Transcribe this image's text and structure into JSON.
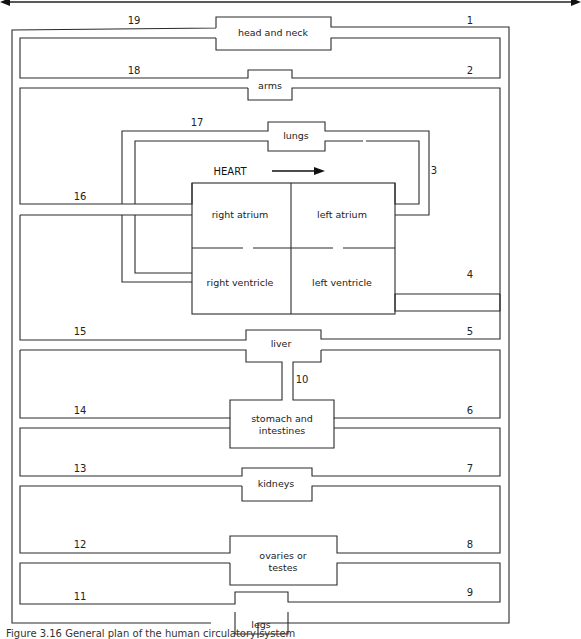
{
  "diagram": {
    "organs": {
      "head": "head and neck",
      "arms": "arms",
      "lungs": "lungs",
      "heart": "HEART",
      "right_atrium": "right atrium",
      "left_atrium": "left atrium",
      "right_ventricle": "right ventricle",
      "left_ventricle": "left ventricle",
      "liver": "liver",
      "stomach_1": "stomach and",
      "stomach_2": "intestines",
      "kidneys": "kidneys",
      "gonads_1": "ovaries or",
      "gonads_2": "testes",
      "legs": "legs"
    },
    "vessel_numbers": {
      "n1": "1",
      "n2": "2",
      "n3": "3",
      "n4": "4",
      "n5": "5",
      "n6": "6",
      "n7": "7",
      "n8": "8",
      "n9": "9",
      "n10": "10",
      "n11": "11",
      "n12": "12",
      "n13": "13",
      "n14": "14",
      "n15": "15",
      "n16": "16",
      "n17": "17",
      "n18": "18",
      "n19": "19"
    }
  },
  "caption": "Figure 3.16 General plan of the human circulatory system"
}
